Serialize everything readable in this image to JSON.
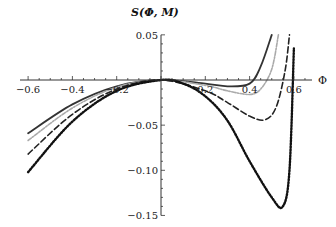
{
  "chart_data": {
    "type": "line",
    "title": "",
    "xlabel": "Φ",
    "ylabel": "S(Φ, M)",
    "xlim": [
      -0.62,
      0.68
    ],
    "ylim": [
      -0.15,
      0.05
    ],
    "grid": false,
    "legend": null,
    "x_ticks": [
      -0.6,
      -0.4,
      -0.2,
      0.2,
      0.4,
      0.6
    ],
    "x_tick_labels": [
      "-0.6",
      "-0.4",
      "-0.2",
      "0.2",
      "0.4",
      "0.6"
    ],
    "y_ticks": [
      0.05,
      -0.05,
      -0.1,
      -0.15
    ],
    "y_tick_labels": [
      "0.05",
      "−0.05",
      "−0.10",
      "−0.15"
    ],
    "series": [
      {
        "name": "solid",
        "style": "solid",
        "color": "#333333",
        "x": [
          -0.6,
          -0.4,
          -0.2,
          0.0,
          0.2,
          0.3,
          0.4,
          0.45,
          0.5
        ],
        "values": [
          -0.059,
          -0.027,
          -0.007,
          0.0,
          -0.004,
          -0.007,
          -0.004,
          0.015,
          0.05
        ]
      },
      {
        "name": "gray-dashed",
        "style": "dashdot",
        "color": "#aaaaaa",
        "x": [
          -0.6,
          -0.4,
          -0.2,
          0.0,
          0.2,
          0.3,
          0.4,
          0.45,
          0.5,
          0.53
        ],
        "values": [
          -0.067,
          -0.031,
          -0.008,
          0.0,
          -0.006,
          -0.012,
          -0.016,
          -0.01,
          0.012,
          0.05
        ]
      },
      {
        "name": "dashed",
        "style": "dashed",
        "color": "#222222",
        "x": [
          -0.6,
          -0.4,
          -0.2,
          0.0,
          0.2,
          0.3,
          0.4,
          0.47,
          0.52,
          0.56,
          0.58
        ],
        "values": [
          -0.082,
          -0.038,
          -0.01,
          0.0,
          -0.012,
          -0.025,
          -0.04,
          -0.044,
          -0.03,
          0.01,
          0.05
        ]
      },
      {
        "name": "dotted",
        "style": "dotted",
        "color": "#111111",
        "x": [
          -0.6,
          -0.4,
          -0.2,
          0.0,
          0.1,
          0.2,
          0.3,
          0.4,
          0.5,
          0.55,
          0.58,
          0.6
        ],
        "values": [
          -0.102,
          -0.046,
          -0.012,
          0.0,
          -0.004,
          -0.018,
          -0.045,
          -0.09,
          -0.13,
          -0.14,
          -0.1,
          0.035
        ]
      }
    ]
  }
}
